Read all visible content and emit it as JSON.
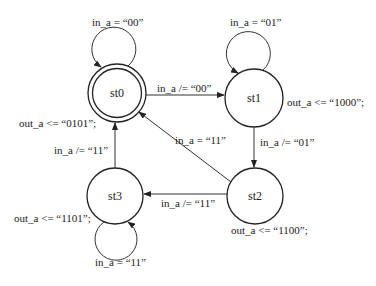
{
  "diagram": {
    "type": "state-machine",
    "states": [
      {
        "id": "st0",
        "label": "st0",
        "initial": true,
        "output": "out_a <= “0101”;"
      },
      {
        "id": "st1",
        "label": "st1",
        "initial": false,
        "output": "out_a <= “1000”;"
      },
      {
        "id": "st2",
        "label": "st2",
        "initial": false,
        "output": "out_a <= “1100”;"
      },
      {
        "id": "st3",
        "label": "st3",
        "initial": false,
        "output": "out_a <= “1101”;"
      }
    ],
    "transitions": [
      {
        "from": "st0",
        "to": "st0",
        "label": "in_a = “00”"
      },
      {
        "from": "st0",
        "to": "st1",
        "label": "in_a /= “00”"
      },
      {
        "from": "st1",
        "to": "st1",
        "label": "in_a = “01”"
      },
      {
        "from": "st1",
        "to": "st2",
        "label": "in_a /= “01”"
      },
      {
        "from": "st2",
        "to": "st0",
        "label": "in_a = “11”"
      },
      {
        "from": "st2",
        "to": "st3",
        "label": "in_a /= “11”"
      },
      {
        "from": "st3",
        "to": "st3",
        "label": "in_a = “11”"
      },
      {
        "from": "st3",
        "to": "st0",
        "label": "in_a /= “11”"
      }
    ]
  }
}
